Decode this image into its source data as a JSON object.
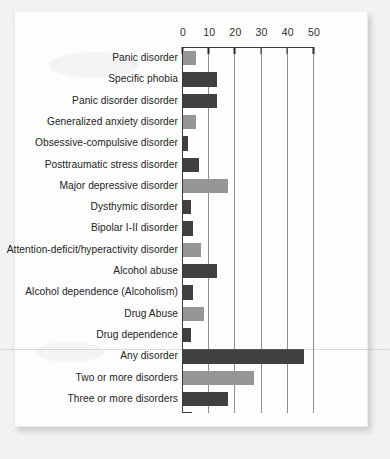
{
  "chart_data": {
    "type": "bar",
    "orientation": "horizontal",
    "title": "",
    "subtitle": "",
    "xlabel": "",
    "ylabel": "",
    "xlim": [
      0,
      50
    ],
    "xticks": [
      0,
      10,
      20,
      30,
      40,
      50
    ],
    "xticklabels": [
      "0",
      "10",
      "20",
      "30",
      "40",
      "50"
    ],
    "grid": true,
    "grid_axis": "x",
    "legend": false,
    "legend_position": "none",
    "colors": {
      "light_bar": "#969696",
      "dark_bar": "#404040",
      "axis": "#3a3a3a",
      "gridline": "#8e8e8e",
      "text": "#242424",
      "paper": "#fdfdfd",
      "background": "#f2f2f2"
    },
    "categories": [
      "Panic disorder",
      "Specific phobia",
      "Panic disorder disorder",
      "Generalized anxiety disorder",
      "Obsessive-compulsive disorder",
      "Posttraumatic stress disorder",
      "Major depressive disorder",
      "Dysthymic disorder",
      "Bipolar I-II disorder",
      "Attention-deficit/hyperactivity disorder",
      "Alcohol abuse",
      "Alcohol dependence (Alcoholism)",
      "Drug Abuse",
      "Drug dependence",
      "Any disorder",
      "Two or more disorders",
      "Three or more disorders"
    ],
    "values": [
      5,
      13,
      13,
      5,
      2,
      6,
      17,
      3,
      4,
      7,
      13,
      4,
      8,
      3,
      46,
      27,
      17
    ],
    "bar_shades": [
      "light",
      "dark",
      "dark",
      "light",
      "dark",
      "dark",
      "light",
      "dark",
      "dark",
      "light",
      "dark",
      "dark",
      "light",
      "dark",
      "dark",
      "light",
      "dark"
    ]
  }
}
